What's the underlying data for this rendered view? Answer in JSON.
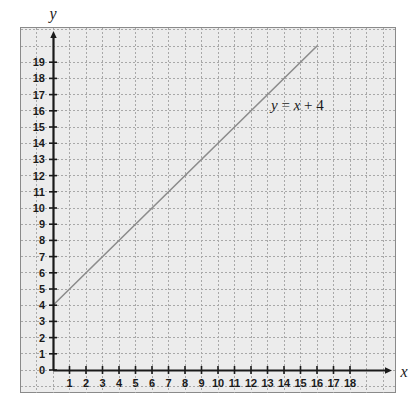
{
  "chart_data": {
    "type": "line",
    "title": "",
    "xlabel": "x",
    "ylabel": "y",
    "xlim": [
      0,
      19.5
    ],
    "ylim": [
      0,
      20.8
    ],
    "grid": true,
    "grid_major_step": 1,
    "legend": "none",
    "annotations": [
      {
        "name": "line-equation",
        "text": "y = x + 4",
        "text_parts": [
          "y",
          " = ",
          "x",
          " + 4"
        ],
        "x": 13.0,
        "y": 16.6
      }
    ],
    "series": [
      {
        "name": "y = x + 4",
        "type": "line",
        "color": "#8c8c8c",
        "slope": 1,
        "intercept": 4,
        "x": [
          0,
          16
        ],
        "values": [
          4,
          20
        ],
        "points": [
          [
            0,
            4
          ],
          [
            1,
            5
          ],
          [
            2,
            6
          ],
          [
            3,
            7
          ],
          [
            4,
            8
          ],
          [
            5,
            9
          ],
          [
            6,
            10
          ],
          [
            7,
            11
          ],
          [
            8,
            12
          ],
          [
            9,
            13
          ],
          [
            10,
            14
          ],
          [
            11,
            15
          ],
          [
            12,
            16
          ],
          [
            13,
            17
          ],
          [
            14,
            18
          ],
          [
            15,
            19
          ],
          [
            16,
            20
          ]
        ]
      }
    ],
    "x_ticks": [
      1,
      2,
      3,
      4,
      5,
      6,
      7,
      8,
      9,
      10,
      11,
      12,
      13,
      14,
      15,
      16,
      17,
      18
    ],
    "x_tick_labels": [
      "1",
      "2",
      "3",
      "4",
      "5",
      "6",
      "7",
      "8",
      "9",
      "10",
      "11",
      "12",
      "13",
      "14",
      "15",
      "16",
      "17",
      "18"
    ],
    "y_ticks": [
      0,
      1,
      2,
      3,
      4,
      5,
      6,
      7,
      8,
      9,
      10,
      11,
      12,
      13,
      14,
      15,
      16,
      17,
      18,
      19
    ],
    "y_tick_labels": [
      "0",
      "1",
      "2",
      "3",
      "4",
      "5",
      "6",
      "7",
      "8",
      "9",
      "10",
      "11",
      "12",
      "13",
      "14",
      "15",
      "16",
      "17",
      "18",
      "19"
    ],
    "origin_label": "0",
    "colors": {
      "plot_background": "#ececec",
      "grid_line": "#a8a8a8",
      "axis": "#1a1a1a",
      "border": "#8a8a8a",
      "line": "#8c8c8c",
      "text": "#1a1a1a",
      "page_background": "#ffffff"
    }
  }
}
